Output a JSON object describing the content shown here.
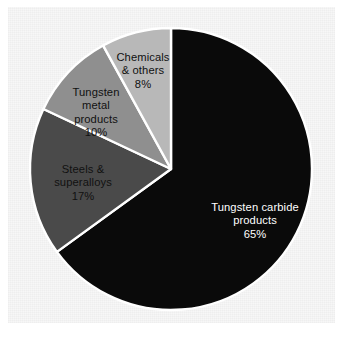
{
  "figure": {
    "background_color": "#f7f7f7",
    "page_color": "#ffffff"
  },
  "chart_data": {
    "type": "pie",
    "title": "",
    "subtitle": "",
    "xlabel": "",
    "ylabel": "",
    "legend_position": "none",
    "grid": false,
    "units": "percent",
    "start_angle_deg": 0,
    "direction": "clockwise",
    "center": {
      "x": 171,
      "y": 169
    },
    "radius": 141,
    "separator_color": "#ffffff",
    "categories": [
      "Tungsten carbide products",
      "Steels & superalloys",
      "Tungsten metal products",
      "Chemicals & others"
    ],
    "values": [
      65,
      17,
      10,
      8
    ],
    "colors": [
      "#0a0a0a",
      "#4a4a4a",
      "#8f8f8f",
      "#b8b8b8"
    ],
    "slices": [
      {
        "name": "Tungsten carbide products",
        "label_lines": "Tungsten carbide\nproducts",
        "value": 65,
        "value_label": "65%",
        "color": "#0a0a0a",
        "text_color": "#ffffff",
        "start_deg": 0,
        "end_deg": 234
      },
      {
        "name": "Steels & superalloys",
        "label_lines": "Steels &\nsuperalloys",
        "value": 17,
        "value_label": "17%",
        "color": "#4a4a4a",
        "text_color": "#111111",
        "start_deg": 234,
        "end_deg": 295.2
      },
      {
        "name": "Tungsten metal products",
        "label_lines": "Tungsten\nmetal\nproducts",
        "value": 10,
        "value_label": "10%",
        "color": "#8f8f8f",
        "text_color": "#111111",
        "start_deg": 295.2,
        "end_deg": 331.2
      },
      {
        "name": "Chemicals & others",
        "label_lines": "Chemicals\n& others",
        "value": 8,
        "value_label": "8%",
        "color": "#b8b8b8",
        "text_color": "#111111",
        "start_deg": 331.2,
        "end_deg": 360
      }
    ]
  }
}
